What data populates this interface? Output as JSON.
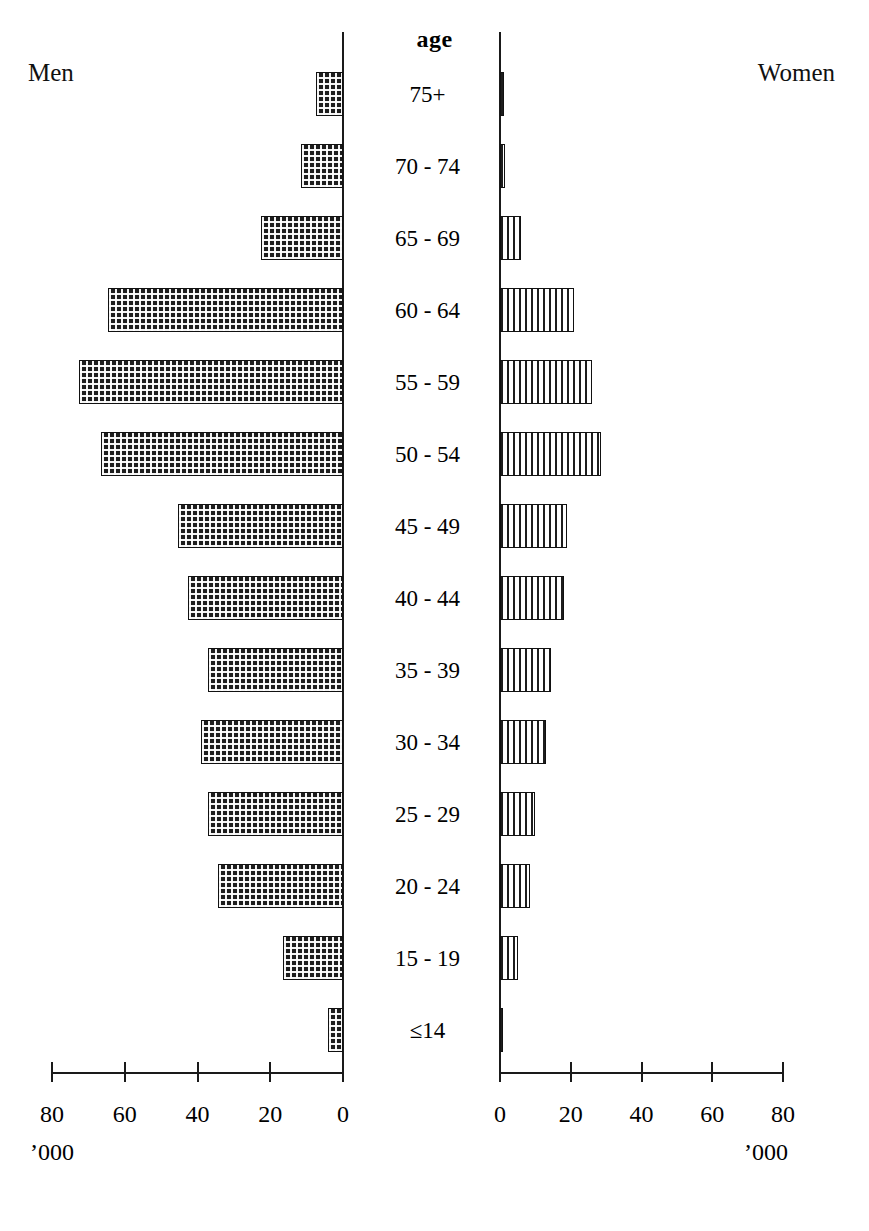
{
  "chart_data": {
    "type": "bar",
    "subtype": "population-pyramid",
    "title": "",
    "center_heading": "age",
    "left_panel_label": "Men",
    "right_panel_label": "Women",
    "xlabel": "",
    "ylabel": "age",
    "unit_label": "'000",
    "grid": false,
    "legend_position": "none",
    "xlim": [
      0,
      80
    ],
    "axis_ticks": [
      0,
      20,
      40,
      60,
      80
    ],
    "left_axis_tick_labels": [
      "80",
      "60",
      "40",
      "20",
      "0"
    ],
    "right_axis_tick_labels": [
      "0",
      "20",
      "40",
      "60",
      "80"
    ],
    "categories": [
      "75+",
      "70 - 74",
      "65 - 69",
      "60 - 64",
      "55 - 59",
      "50 - 54",
      "45 - 49",
      "40 - 44",
      "35 - 39",
      "30 - 34",
      "25 - 29",
      "20 - 24",
      "15 - 19",
      "≤14"
    ],
    "series": [
      {
        "name": "Men",
        "side": "left",
        "fill": "cross-hatch",
        "values": [
          7.5,
          11.5,
          22.5,
          64.5,
          72.5,
          66.5,
          45.5,
          42.5,
          37.0,
          39.0,
          37.0,
          34.5,
          16.5,
          4.0
        ]
      },
      {
        "name": "Women",
        "side": "right",
        "fill": "vertical-stripes",
        "values": [
          1.0,
          1.5,
          6.0,
          21.0,
          26.0,
          28.5,
          19.0,
          18.0,
          14.5,
          13.0,
          10.0,
          8.5,
          5.0,
          0.8
        ]
      }
    ]
  },
  "labels": {
    "men": "Men",
    "women": "Women",
    "age": "age",
    "unit": "’000"
  },
  "colors": {
    "ink": "#111111",
    "background": "#ffffff",
    "bar_fill": "#1d1d1d"
  }
}
